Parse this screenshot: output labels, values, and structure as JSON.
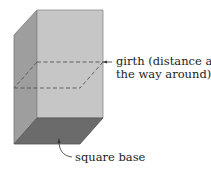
{
  "diagram": {
    "labels": {
      "girth_line1": "girth (distance all",
      "girth_line2": "the way around)",
      "base": "square base"
    },
    "colors": {
      "front_face": "#c6c6c6",
      "left_face": "#9e9e9e",
      "base": "#6b6b6b",
      "edge": "#7a7a7a",
      "dash": "#555555",
      "text": "#222222"
    }
  }
}
